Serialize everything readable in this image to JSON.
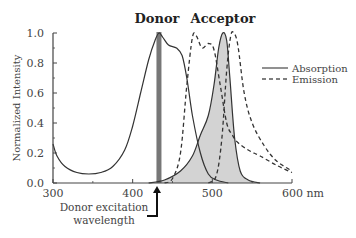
{
  "chart_data": {
    "type": "line",
    "title": "",
    "xlabel": "nm",
    "ylabel": "Normalized Intensity",
    "xlim": [
      300,
      600
    ],
    "ylim": [
      0.0,
      1.0
    ],
    "x_ticks": [
      "300",
      "400",
      "500",
      "600 nm"
    ],
    "y_ticks": [
      "0.0",
      "0.2",
      "0.4",
      "0.6",
      "0.8",
      "1.0"
    ],
    "grid": false,
    "legend_position": "right",
    "legend": [
      {
        "label": "Absorption",
        "style": "solid"
      },
      {
        "label": "Emission",
        "style": "dashed"
      }
    ],
    "headers": [
      {
        "label": "Donor",
        "x": 433
      },
      {
        "label": "Acceptor",
        "x": 513
      }
    ],
    "annotations": [
      {
        "text": "Donor excitation wavelength",
        "x": 433,
        "type": "arrow"
      }
    ],
    "excitation_wavelength": 433,
    "series": [
      {
        "name": "Donor absorption",
        "style": "solid",
        "x": [
          300,
          305,
          315,
          330,
          345,
          360,
          375,
          390,
          400,
          410,
          420,
          428,
          433,
          438,
          445,
          455,
          462,
          468,
          475,
          485,
          495,
          505,
          520
        ],
        "y": [
          0.26,
          0.18,
          0.11,
          0.07,
          0.06,
          0.07,
          0.11,
          0.22,
          0.38,
          0.6,
          0.82,
          0.95,
          1.0,
          0.97,
          0.92,
          0.9,
          0.85,
          0.7,
          0.45,
          0.2,
          0.06,
          0.02,
          0.0
        ]
      },
      {
        "name": "Donor emission",
        "style": "dashed",
        "x": [
          440,
          450,
          460,
          468,
          475,
          480,
          487,
          495,
          502,
          510,
          518,
          525,
          532,
          545,
          560,
          580,
          600
        ],
        "y": [
          0.0,
          0.03,
          0.2,
          0.65,
          0.97,
          0.98,
          0.9,
          0.93,
          0.89,
          0.65,
          0.4,
          0.32,
          0.27,
          0.22,
          0.18,
          0.12,
          0.07
        ]
      },
      {
        "name": "Acceptor absorption",
        "style": "solid",
        "fill": "#d3d3d3",
        "x": [
          420,
          440,
          460,
          475,
          485,
          495,
          502,
          508,
          513,
          518,
          522,
          528,
          535,
          545,
          560
        ],
        "y": [
          0.0,
          0.02,
          0.08,
          0.18,
          0.32,
          0.45,
          0.65,
          0.9,
          1.0,
          0.95,
          0.7,
          0.3,
          0.08,
          0.02,
          0.0
        ]
      },
      {
        "name": "Acceptor emission",
        "style": "dashed",
        "x": [
          495,
          505,
          512,
          518,
          523,
          527,
          532,
          540,
          550,
          565,
          580,
          600
        ],
        "y": [
          0.0,
          0.05,
          0.3,
          0.75,
          0.98,
          1.0,
          0.92,
          0.6,
          0.4,
          0.25,
          0.15,
          0.08
        ]
      }
    ]
  },
  "labels": {
    "donor": "Donor",
    "acceptor": "Acceptor",
    "ylabel": "Normalized Intensity",
    "legend_absorption": "Absorption",
    "legend_emission": "Emission",
    "annotation_line1": "Donor excitation",
    "annotation_line2": "wavelength",
    "x_ticks": [
      "300",
      "400",
      "500",
      "600 nm"
    ],
    "y_ticks": [
      "0.0",
      "0.2",
      "0.4",
      "0.6",
      "0.8",
      "1.0"
    ]
  }
}
